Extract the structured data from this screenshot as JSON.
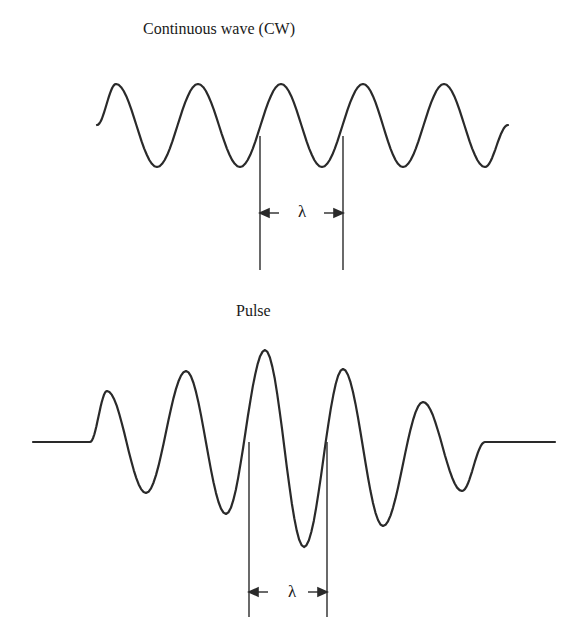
{
  "figure": {
    "panels": [
      {
        "id": "cw",
        "title": "Continuous wave (CW)",
        "wavelength_label": "λ",
        "waveform": {
          "type": "sinusoid",
          "start": [
            97,
            125
          ],
          "end": [
            508,
            125
          ],
          "peaks": [
            [
              116,
              84
            ],
            [
              198,
              84
            ],
            [
              281,
              84
            ],
            [
              363,
              84
            ],
            [
              444,
              84
            ]
          ],
          "troughs": [
            [
              157,
              167
            ],
            [
              240,
              167
            ],
            [
              322,
              167
            ],
            [
              403,
              167
            ],
            [
              485,
              167
            ]
          ]
        },
        "markers": {
          "x": [
            260,
            343
          ],
          "y_top": 136,
          "y_bottom": 270,
          "arrow_y": 213
        }
      },
      {
        "id": "pulse",
        "title": "Pulse",
        "wavelength_label": "λ",
        "waveform": {
          "type": "pulse",
          "baseline_y": 442,
          "left_flat": [
            33,
            90
          ],
          "right_flat": [
            485,
            555
          ],
          "peaks": [
            [
              107,
              391
            ],
            [
              186,
              371
            ],
            [
              265,
              350
            ],
            [
              343,
              369
            ],
            [
              423,
              402
            ]
          ],
          "troughs": [
            [
              146,
              493
            ],
            [
              226,
              514
            ],
            [
              304,
              547
            ],
            [
              383,
              526
            ],
            [
              462,
              491
            ]
          ]
        },
        "markers": {
          "x": [
            249,
            327
          ],
          "y_top": 442,
          "y_bottom": 617,
          "arrow_y": 592
        }
      }
    ],
    "colors": {
      "stroke": "#2a2a2a",
      "text": "#1a1a1a",
      "background": "#ffffff"
    }
  }
}
